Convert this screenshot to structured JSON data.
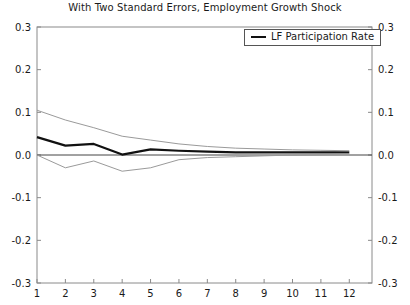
{
  "chart_data": {
    "type": "line",
    "title": "With Two Standard Errors, Employment Growth Shock",
    "xlabel": "",
    "ylabel": "",
    "xlim": [
      1,
      12.8
    ],
    "ylim": [
      -0.3,
      0.3
    ],
    "grid": false,
    "legend_position": "top-right",
    "x_ticks": [
      1,
      2,
      3,
      4,
      5,
      6,
      7,
      8,
      9,
      10,
      11,
      12
    ],
    "x_tick_labels": [
      "1",
      "2",
      "3",
      "4",
      "5",
      "6",
      "7",
      "8",
      "9",
      "10",
      "11",
      "12"
    ],
    "y_ticks": [
      -0.3,
      -0.2,
      -0.1,
      0.0,
      0.1,
      0.2,
      0.3
    ],
    "y_tick_labels": [
      "-0.3",
      "-0.2",
      "-0.1",
      "0.0",
      "0.1",
      "0.2",
      "0.3"
    ],
    "y_axis_right_labels": [
      "-0.3",
      "-0.2",
      "-0.1",
      "0.0",
      "0.1",
      "0.2",
      "0.3"
    ],
    "x": [
      1,
      2,
      3,
      4,
      5,
      6,
      7,
      8,
      9,
      10,
      11,
      12
    ],
    "series": [
      {
        "name": "LF Participation Rate",
        "role": "point-estimate",
        "color": "#111111",
        "width": 2.2,
        "values": [
          0.042,
          0.022,
          0.026,
          0.001,
          0.013,
          0.01,
          0.008,
          0.006,
          0.006,
          0.006,
          0.006,
          0.006
        ]
      },
      {
        "name": "Upper Two Standard Error Band",
        "role": "upper-band",
        "color": "#9a9a9a",
        "width": 1,
        "values": [
          0.105,
          0.082,
          0.064,
          0.044,
          0.035,
          0.026,
          0.02,
          0.016,
          0.014,
          0.012,
          0.011,
          0.01
        ]
      },
      {
        "name": "Lower Two Standard Error Band",
        "role": "lower-band",
        "color": "#9a9a9a",
        "width": 1,
        "values": [
          0.0,
          -0.03,
          -0.014,
          -0.038,
          -0.03,
          -0.011,
          -0.006,
          -0.004,
          -0.002,
          0.0,
          0.001,
          0.002
        ]
      }
    ],
    "zero_line": 0.0
  },
  "legend": {
    "entries": [
      {
        "label": "LF Participation Rate",
        "color": "#111111"
      }
    ]
  }
}
